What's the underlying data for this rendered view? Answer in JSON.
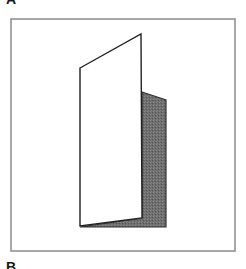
{
  "labels": {
    "top": "A",
    "bottom": "B"
  },
  "figure": {
    "frame": {
      "x": 11,
      "y": 19,
      "width": 224,
      "height": 232,
      "stroke": "#8a8a8a"
    },
    "front_panel": {
      "points": "80,68 141,34 142,218 80,226",
      "fill": "#ffffff",
      "stroke": "#222222"
    },
    "shaded_panel": {
      "points": "142,92 166,100 166,227 80,227 142,218",
      "fill": "#6e6e6e",
      "stroke": "#333333"
    }
  }
}
